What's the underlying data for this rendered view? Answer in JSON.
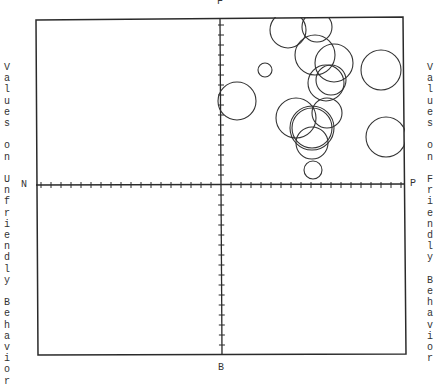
{
  "chart_data": {
    "type": "scatter",
    "subtype": "bubble",
    "title": "",
    "xlabel": "",
    "ylabel_left": "Values on Unfriendly Behavior",
    "ylabel_right": "Values on Friendly Behavior",
    "pole_labels": {
      "top": "F",
      "bottom": "B",
      "left": "N",
      "right": "P"
    },
    "grid": false,
    "axes_cross_at_center": true,
    "xlim": [
      -18,
      18
    ],
    "ylim": [
      -18,
      18
    ],
    "tick_spacing": 1,
    "bubbles": [
      {
        "id": "A",
        "x": 6.7,
        "y": 15.5,
        "r": 1.8
      },
      {
        "id": "B",
        "x": 9.6,
        "y": 15.8,
        "r": 1.5
      },
      {
        "id": "C",
        "x": 9.4,
        "y": 13.0,
        "r": 2.0
      },
      {
        "id": "D",
        "x": 11.3,
        "y": 12.2,
        "r": 1.9
      },
      {
        "id": "E",
        "x": 11.0,
        "y": 10.5,
        "r": 1.5
      },
      {
        "id": "F",
        "x": 10.5,
        "y": 10.2,
        "r": 1.8
      },
      {
        "id": "G",
        "x": 7.5,
        "y": 6.7,
        "r": 2.0
      },
      {
        "id": "H",
        "x": 10.6,
        "y": 7.2,
        "r": 1.5
      },
      {
        "id": "I",
        "x": 9.1,
        "y": 5.7,
        "r": 2.2,
        "double_outline": true
      },
      {
        "id": "J",
        "x": 9.1,
        "y": 4.2,
        "r": 1.6
      },
      {
        "id": "K",
        "x": 9.2,
        "y": 1.5,
        "r": 0.9
      },
      {
        "id": "L",
        "x": 1.6,
        "y": 8.4,
        "r": 1.9
      },
      {
        "id": "M",
        "x": 4.4,
        "y": 11.5,
        "r": 0.7
      },
      {
        "id": "N",
        "x": 16.0,
        "y": 11.5,
        "r": 2.0
      },
      {
        "id": "O",
        "x": 16.5,
        "y": 4.8,
        "r": 2.0
      }
    ]
  },
  "layout": {
    "frame": {
      "left": 36,
      "top": 19,
      "right": 405,
      "bottom": 355
    },
    "origin": {
      "x": 221,
      "y": 185
    },
    "unit_px": 10,
    "stroke_color": "#2a2a2a",
    "background": "#ffffff"
  }
}
